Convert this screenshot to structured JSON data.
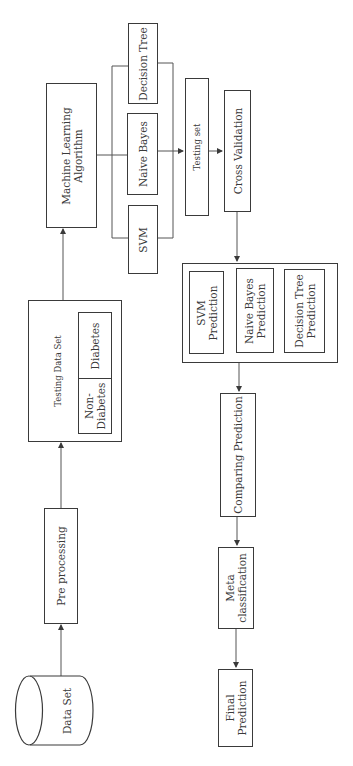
{
  "diagram": {
    "title": "",
    "orientation": "rotated-90-ccw",
    "nodes": {
      "data_set": "Data Set",
      "pre_processing": "Pre processing",
      "testing_data_set": "Testing Data Set",
      "non_diabetes": "Non-\nDiabetes",
      "diabetes": "Diabetes",
      "ml_algorithm": "Machine Learning\nAlgorithm",
      "svm": "SVM",
      "naive_bayes": "Naive Bayes",
      "decision_tree": "Decision Tree",
      "testing_set": "Testing set",
      "cross_validation": "Cross Validation",
      "svm_prediction": "SVM\nPrediction",
      "nb_prediction": "Naive Bayes\nPrediction",
      "dt_prediction": "Decision Tree\nPrediction",
      "comparing_prediction": "Comparing Prediction",
      "meta_classification": "Meta\nclassification",
      "final_prediction": "Final\nPrediction"
    },
    "edges": [
      [
        "Data Set",
        "Pre processing"
      ],
      [
        "Pre processing",
        "Testing Data Set"
      ],
      [
        "Testing Data Set",
        "Machine Learning Algorithm"
      ],
      [
        "Machine Learning Algorithm",
        "SVM / Naive Bayes / Decision Tree"
      ],
      [
        "SVM / Naive Bayes / Decision Tree",
        "Testing set"
      ],
      [
        "Testing set",
        "Cross Validation"
      ],
      [
        "Cross Validation",
        "Predictions"
      ],
      [
        "Predictions",
        "Comparing Prediction"
      ],
      [
        "Comparing Prediction",
        "Meta classification"
      ],
      [
        "Meta classification",
        "Final Prediction"
      ]
    ]
  }
}
